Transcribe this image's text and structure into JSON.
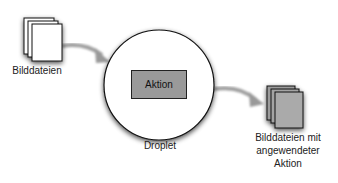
{
  "diagram": {
    "input": {
      "label": "Bilddateien",
      "fill": "#ffffff"
    },
    "droplet": {
      "label": "Droplet",
      "action_label": "Aktion",
      "action_fill": "#9a9a9a"
    },
    "output": {
      "label_lines": [
        "Bilddateien mit",
        "angewendeter",
        "Aktion"
      ],
      "fill": "#a8a8a8"
    },
    "edges": [
      {
        "from": "input",
        "to": "droplet"
      },
      {
        "from": "droplet",
        "to": "output"
      }
    ]
  }
}
